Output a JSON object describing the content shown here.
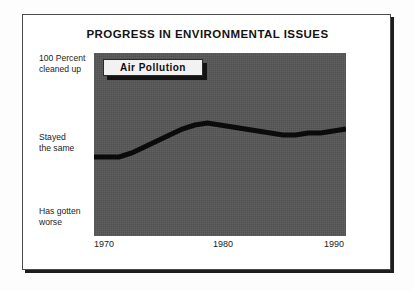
{
  "chart_data": {
    "type": "line",
    "title": "PROGRESS IN ENVIRONMENTAL ISSUES",
    "xlabel": "",
    "ylabel": "",
    "grid": false,
    "legend_position": "inline-callout",
    "series": [
      {
        "name": "Air Pollution",
        "x": [
          1970,
          1971,
          1972,
          1973,
          1974,
          1975,
          1976,
          1977,
          1978,
          1979,
          1980,
          1981,
          1982,
          1983,
          1984,
          1985,
          1986,
          1987,
          1988,
          1989,
          1990
        ],
        "values": [
          50,
          50,
          50,
          52,
          55,
          58,
          61,
          64,
          66,
          67,
          66,
          65,
          64,
          63,
          62,
          61,
          61,
          62,
          62,
          63,
          64
        ]
      }
    ],
    "x_ticks": [
      1970,
      1980,
      1990
    ],
    "x_tick_labels": [
      "1970",
      "1980",
      "1990"
    ],
    "xlim": [
      1970,
      1990
    ],
    "ylim": [
      0,
      100
    ],
    "y_category_labels": [
      {
        "line1": "100 Percent",
        "line2": "cleaned up",
        "value": 100
      },
      {
        "line1": "Stayed",
        "line2": "the same",
        "value": 50
      },
      {
        "line1": "Has gotten",
        "line2": "worse",
        "value": 10
      }
    ],
    "colors": {
      "plot_background": "#565656",
      "series_line": "#0b0b0b",
      "callout_fill": "#f2f2f2",
      "callout_border": "#2a2a2a",
      "text": "#1c1c1c",
      "frame": "#4a4a4a",
      "frame_shadow": "#1d1d1d",
      "page_background": "#fdfdfd"
    }
  },
  "figure": {
    "title": "PROGRESS IN ENVIRONMENTAL ISSUES",
    "callout_label": "Air Pollution",
    "y_labels": {
      "top": {
        "line1": "100 Percent",
        "line2": "cleaned up"
      },
      "middle": {
        "line1": "Stayed",
        "line2": "the same"
      },
      "bottom": {
        "line1": "Has gotten",
        "line2": "worse"
      }
    },
    "x_labels": {
      "first": "1970",
      "second": "1980",
      "third": "1990"
    }
  }
}
